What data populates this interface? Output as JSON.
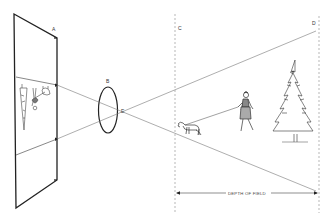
{
  "diagram": {
    "labels": {
      "film_plane": "A",
      "lens_top": "B",
      "near_limit": "C",
      "far_limit": "D",
      "lens_point": "E",
      "depth_of_field": "DEPTH OF FIELD"
    },
    "elements": [
      "film-plane",
      "lens",
      "light-rays",
      "near-focus-limit",
      "far-focus-limit",
      "dog",
      "woman-with-leash",
      "pine-tree",
      "depth-of-field-arrow",
      "inverted-image-on-film"
    ],
    "colors": {
      "stroke": "#222222",
      "ray": "#777777",
      "dashed": "#999999",
      "background": "#ffffff"
    }
  }
}
